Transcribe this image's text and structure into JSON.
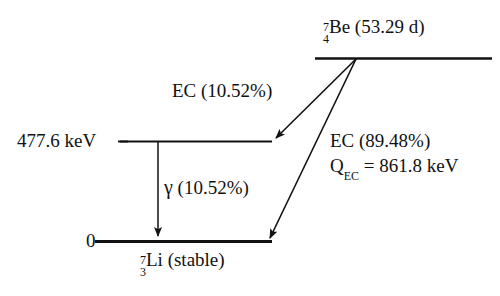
{
  "diagram": {
    "type": "nuclear-decay-scheme",
    "colors": {
      "line": "#111111",
      "text": "#111111",
      "background": "#ffffff"
    },
    "levels": [
      {
        "id": "parent",
        "nuclide": {
          "mass_number": "7",
          "atomic_number": "4",
          "symbol": "Be"
        },
        "annotation": "(53.29 d)",
        "label_text": "Be (53.29 d)",
        "energy_label": ""
      },
      {
        "id": "excited",
        "energy_label": "477.6 keV",
        "nuclide": null,
        "annotation": ""
      },
      {
        "id": "ground",
        "energy_label": "0",
        "nuclide": {
          "mass_number": "7",
          "atomic_number": "3",
          "symbol": "Li"
        },
        "annotation": "(stable)",
        "label_text": "Li (stable)"
      }
    ],
    "transitions": [
      {
        "id": "ec-to-excited",
        "label": "EC (10.52%)",
        "kind": "electron-capture"
      },
      {
        "id": "ec-to-ground",
        "label": "EC (89.48%)",
        "kind": "electron-capture"
      },
      {
        "id": "gamma",
        "symbol": "γ",
        "label": "(10.52%)",
        "full_label": "γ (10.52%)",
        "kind": "gamma"
      }
    ],
    "q_value": {
      "symbol": "Q",
      "subscript": "EC",
      "equals": "=",
      "value": "861.8 keV",
      "full_label": "Q_EC = 861.8 keV"
    }
  }
}
